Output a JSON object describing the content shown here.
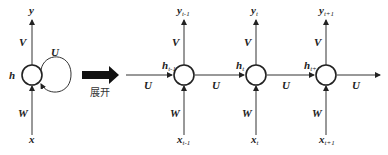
{
  "diagram": {
    "folded": {
      "input": "x",
      "hidden": "h",
      "output": "y",
      "weight_in": "W",
      "weight_out": "V",
      "weight_recurrent": "U"
    },
    "unfold_label": "展开",
    "unrolled": {
      "recurrent_weight": "U",
      "steps": [
        {
          "input": "x",
          "input_sub": "t-1",
          "hidden": "h",
          "hidden_sub": "t-1",
          "output": "y",
          "output_sub": "t-1",
          "weight_in": "W",
          "weight_out": "V"
        },
        {
          "input": "x",
          "input_sub": "t",
          "hidden": "h",
          "hidden_sub": "t",
          "output": "y",
          "output_sub": "t",
          "weight_in": "W",
          "weight_out": "V"
        },
        {
          "input": "x",
          "input_sub": "t+1",
          "hidden": "h",
          "hidden_sub": "t+1",
          "output": "y",
          "output_sub": "t+1",
          "weight_in": "W",
          "weight_out": "V"
        }
      ]
    }
  }
}
